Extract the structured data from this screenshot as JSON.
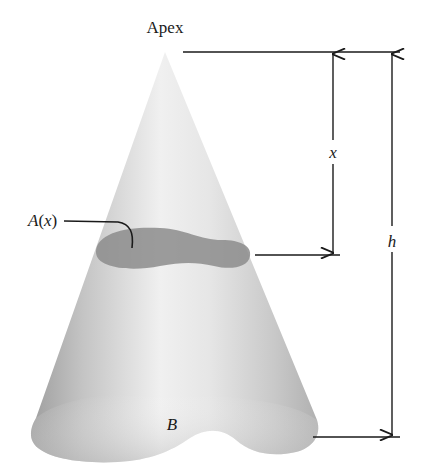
{
  "figure": {
    "type": "cone-cross-section-diagram",
    "labels": {
      "apex": "Apex",
      "cross_section": "A(x)",
      "distance": "x",
      "height": "h",
      "base": "B"
    },
    "colors": {
      "cone_light": "#f2f2f2",
      "cone_mid": "#d4d4d4",
      "cone_dark": "#a8a8a8",
      "cross_section_fill": "#8c8c8c",
      "line": "#1a1a1a",
      "background": "#ffffff"
    }
  }
}
